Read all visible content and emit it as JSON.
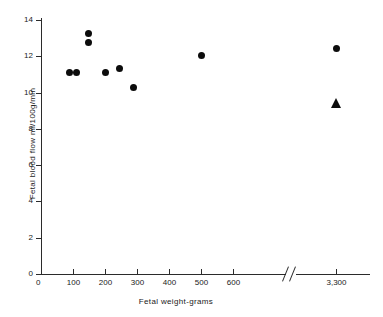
{
  "chart_data": {
    "type": "scatter",
    "title": "",
    "xlabel": "Fetal weight-grams",
    "ylabel": "Fetal blood  flow ml/100g/min",
    "grid": false,
    "legend": "none",
    "xlim": [
      0,
      700
    ],
    "ylim": [
      0,
      14
    ],
    "x_axis_break": {
      "present": true,
      "after": 600,
      "resumes_at": 3300,
      "symbol": "//"
    },
    "xticks": [
      0,
      100,
      200,
      300,
      400,
      500,
      600,
      3300
    ],
    "xtick_labels": [
      "0",
      "100",
      "200",
      "300",
      "400",
      "500",
      "600",
      "3,300"
    ],
    "yticks": [
      0,
      2,
      4,
      6,
      8,
      10,
      12,
      14
    ],
    "ytick_labels": [
      "0",
      "2",
      "4",
      "6",
      "8",
      "10",
      "12",
      "14"
    ],
    "series": [
      {
        "name": "fetal lambs",
        "marker": "circle",
        "color": "#0c0c0c",
        "points": [
          {
            "x": 90,
            "y": 11.1
          },
          {
            "x": 112,
            "y": 11.1
          },
          {
            "x": 148,
            "y": 13.25
          },
          {
            "x": 148,
            "y": 12.75
          },
          {
            "x": 202,
            "y": 11.1
          },
          {
            "x": 245,
            "y": 11.35
          },
          {
            "x": 290,
            "y": 10.3
          },
          {
            "x": 500,
            "y": 12.05
          },
          {
            "x": 645,
            "y": 12.45
          }
        ]
      },
      {
        "name": "term newborn",
        "marker": "triangle",
        "color": "#0c0c0c",
        "points": [
          {
            "x": 3300,
            "y": 9.4
          }
        ]
      }
    ]
  }
}
